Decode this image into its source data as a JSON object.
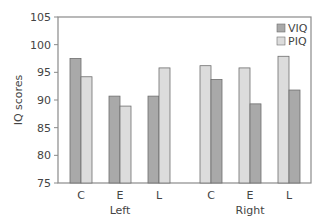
{
  "chart_data": {
    "type": "bar",
    "title": "",
    "xlabel": "",
    "ylabel": "IQ scores",
    "ylim": [
      75,
      105
    ],
    "yticks": [
      75,
      80,
      85,
      90,
      95,
      100,
      105
    ],
    "grid": false,
    "legend_position": "top-right",
    "groups": [
      {
        "name": "Left",
        "categories": [
          "C",
          "E",
          "L"
        ],
        "bar_order": [
          "VIQ",
          "PIQ"
        ],
        "series": [
          {
            "name": "VIQ",
            "values": [
              97.5,
              90.7,
              90.7
            ]
          },
          {
            "name": "PIQ",
            "values": [
              94.2,
              88.9,
              95.8
            ]
          }
        ]
      },
      {
        "name": "Right",
        "categories": [
          "C",
          "E",
          "L"
        ],
        "bar_order": [
          "PIQ",
          "VIQ"
        ],
        "series": [
          {
            "name": "VIQ",
            "values": [
              93.7,
              89.3,
              91.8
            ]
          },
          {
            "name": "PIQ",
            "values": [
              96.2,
              95.8,
              97.9
            ]
          }
        ]
      }
    ],
    "legend": [
      {
        "name": "VIQ",
        "color": "#a9a9a9"
      },
      {
        "name": "PIQ",
        "color": "#dcdcdc"
      }
    ]
  },
  "colors": {
    "VIQ": "#a9a9a9",
    "PIQ": "#dcdcdc",
    "bar_stroke": "#6e6e6e",
    "axis": "#8a8a8a"
  }
}
